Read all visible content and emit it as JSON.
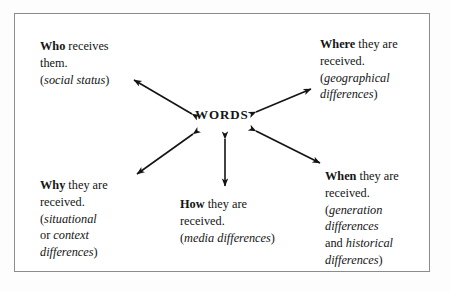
{
  "diagram": {
    "center": {
      "label": "WORDS"
    },
    "nodes": [
      {
        "id": "who",
        "keyword": "Who",
        "rest": " receives",
        "line2": "them.",
        "paren_open": "(",
        "paren_italic": "social status",
        "paren_close": ")"
      },
      {
        "id": "where",
        "keyword": "Where",
        "rest": " they are",
        "line2": "received.",
        "paren_open": "(",
        "paren_italic": "geographical",
        "paren_italic2": "differences",
        "paren_close": ")"
      },
      {
        "id": "why",
        "keyword": "Why",
        "rest": " they are",
        "line2": "received.",
        "paren_open": "(",
        "paren_italic": "situational",
        "conjunction": "or ",
        "paren_italic2": "context",
        "paren_italic3": "differences",
        "paren_close": ")"
      },
      {
        "id": "how",
        "keyword": "How",
        "rest": " they are",
        "line2": "received.",
        "paren_open": "(",
        "paren_italic": "media differences",
        "paren_close": ")"
      },
      {
        "id": "when",
        "keyword": "When",
        "rest": " they are",
        "line2": "received.",
        "paren_open": "(",
        "paren_italic": "generation",
        "paren_italic2": "differences",
        "conjunction": "and ",
        "paren_italic3": "historical",
        "paren_italic4": "differences",
        "paren_close": ")"
      }
    ],
    "colors": {
      "ink": "#141414",
      "frame": "#8c8c8c",
      "background": "#ffffff"
    }
  }
}
